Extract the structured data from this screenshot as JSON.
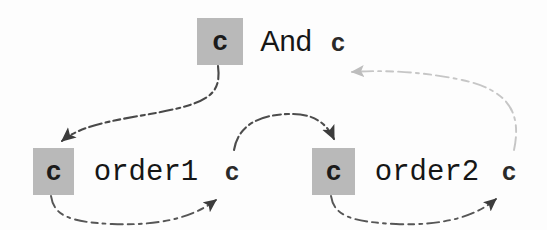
{
  "diagram": {
    "colors": {
      "cursor_box_fill": "#b9b9b9",
      "text": "#161616",
      "arrow_dark": "#4a4a4a",
      "arrow_light": "#c2c2c2",
      "background": "#fdfdfd"
    },
    "nodes": [
      {
        "id": "top-cursor-box",
        "label": "c",
        "kind": "cursor-box",
        "x": 197,
        "y": 18,
        "w": 46,
        "h": 47
      },
      {
        "id": "top-keyword",
        "label": "And",
        "kind": "token-label",
        "x": 255,
        "y": 22,
        "w": 62,
        "h": 38
      },
      {
        "id": "top-cursor-plain",
        "label": "c",
        "kind": "cursor-plain",
        "x": 328,
        "y": 26,
        "w": 20,
        "h": 32
      },
      {
        "id": "order1-cursor-box",
        "label": "c",
        "kind": "cursor-box",
        "x": 33,
        "y": 148,
        "w": 41,
        "h": 47
      },
      {
        "id": "order1-word",
        "label": "order1",
        "kind": "token-word",
        "x": 85,
        "y": 153,
        "w": 122,
        "h": 38
      },
      {
        "id": "order1-cursor-end",
        "label": "c",
        "kind": "cursor-plain",
        "x": 222,
        "y": 155,
        "w": 20,
        "h": 32
      },
      {
        "id": "order2-cursor-box",
        "label": "c",
        "kind": "cursor-box",
        "x": 312,
        "y": 148,
        "w": 43,
        "h": 47
      },
      {
        "id": "order2-word",
        "label": "order2",
        "kind": "token-word",
        "x": 366,
        "y": 153,
        "w": 122,
        "h": 38
      },
      {
        "id": "order2-cursor-end",
        "label": "c",
        "kind": "cursor-plain",
        "x": 499,
        "y": 155,
        "w": 20,
        "h": 32
      }
    ],
    "arrows": [
      {
        "id": "arrow-top-to-order1",
        "style": "dark",
        "from": "top-cursor-box",
        "to": "order1-cursor-box"
      },
      {
        "id": "arrow-order1-under",
        "style": "dark",
        "from": "order1-cursor-box",
        "to": "order1-cursor-end"
      },
      {
        "id": "arrow-order1-to-order2",
        "style": "dark",
        "from": "order1-cursor-end",
        "to": "order2-cursor-box"
      },
      {
        "id": "arrow-order2-under",
        "style": "dark",
        "from": "order2-cursor-box",
        "to": "order2-cursor-end"
      },
      {
        "id": "arrow-order2-to-top",
        "style": "light",
        "from": "order2-cursor-end",
        "to": "top-cursor-plain"
      }
    ]
  }
}
